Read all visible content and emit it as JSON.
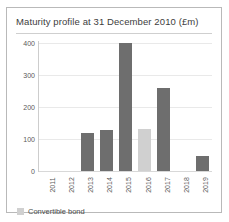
{
  "card": {
    "title": "Maturity profile at 31 December 2010 (£m)"
  },
  "legend": {
    "items": [
      {
        "label": "Convertible bond",
        "color": "#d0d0d0"
      }
    ]
  },
  "colors": {
    "bar_default": "#6e6e6e",
    "bar_convertible": "#d0d0d0",
    "gridline": "#e9e9e9",
    "axis": "#cdcdcd",
    "border": "#b9b9b9",
    "title_text": "#3d3d3d",
    "tick_text": "#5a5a5a"
  },
  "chart_data": {
    "type": "bar",
    "title": "Maturity profile at 31 December 2010 (£m)",
    "xlabel": "",
    "ylabel": "",
    "ylim": [
      0,
      400
    ],
    "yticks": [
      0,
      100,
      200,
      300,
      400
    ],
    "ytick_labels": [
      "0",
      "100",
      "200",
      "300",
      "400"
    ],
    "grid": true,
    "legend_position": "bottom-left",
    "categories": [
      "2011",
      "2012",
      "2013",
      "2014",
      "2015",
      "2016",
      "2017",
      "2018",
      "2019"
    ],
    "values": [
      0,
      0,
      120,
      128,
      400,
      132,
      258,
      0,
      48
    ],
    "series": [
      {
        "name": "Debt maturity",
        "values": [
          0,
          0,
          120,
          128,
          400,
          0,
          258,
          0,
          48
        ],
        "color": "#6e6e6e"
      },
      {
        "name": "Convertible bond",
        "values": [
          0,
          0,
          0,
          0,
          0,
          132,
          0,
          0,
          0
        ],
        "color": "#d0d0d0"
      }
    ],
    "bar_types": [
      "empty",
      "empty",
      "default",
      "default",
      "default",
      "convertible",
      "default",
      "empty",
      "default"
    ]
  }
}
